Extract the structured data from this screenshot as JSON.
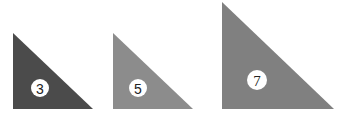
{
  "triangles": [
    {
      "label": "3",
      "color": "#4b4b4b",
      "points": "13,33 13,109 93,109",
      "cx": 40,
      "cy": 88,
      "r": 9
    },
    {
      "label": "5",
      "color": "#8c8c8c",
      "points": "113,33 113,109 193,109",
      "cx": 138,
      "cy": 88,
      "r": 9
    },
    {
      "label": "7",
      "color": "#808080",
      "points": "222,2 222,109 334,109",
      "cx": 257,
      "cy": 80,
      "r": 10
    }
  ]
}
